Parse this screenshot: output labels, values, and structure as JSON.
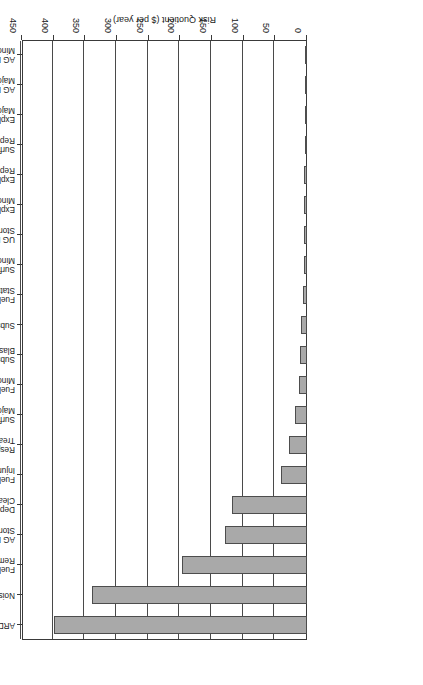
{
  "chart_data": {
    "type": "bar",
    "orientation": "horizontal",
    "title": "",
    "xlabel": "Risk Quotient ($ per year)",
    "ylabel": "",
    "xlim": [
      0,
      450
    ],
    "xticks": [
      0,
      50,
      100,
      150,
      200,
      250,
      300,
      350,
      400,
      450
    ],
    "grid": true,
    "legend": false,
    "rotated_180": true,
    "bar_color": "#a9a9a9",
    "bar_edge_color": "#4d4d4d",
    "categories": [
      "ARD Remediation",
      "Noise Remediation",
      "Fuel Transport Remediation",
      "AG Explosives Storage Repair",
      "Deposited Dust Cleanup",
      "Fuel Transport Major Injury, Death",
      "Respirable Dust Treatment 5 People",
      "Surface Blasting Major Injury, Death",
      "Fuel Transport Minor Injury",
      "Subsurface Blasting Repair",
      "Subsidence Repair",
      "Fuel Transport Statutory Fine",
      "Surface Blasting Minor Injury",
      "UG Explosives Storage Repair",
      "Explosives Transport Minor Injury",
      "Explosives Transport Repair",
      "Surface Blasting Repair",
      "Explosives Transport Major Injury, Death",
      "AG Explosives Storage Major Injury, Death",
      "AG Explosives Storage Minor Injury"
    ],
    "category_lines": [
      [
        "ARD Remediation",
        ""
      ],
      [
        "Noise Remediation",
        ""
      ],
      [
        "Fuel Transport",
        "Remediation"
      ],
      [
        "AG Explosives",
        "Storage Repair"
      ],
      [
        "Deposited Dust",
        "Cleanup"
      ],
      [
        "Fuel Transport Major",
        "Injury, Death"
      ],
      [
        "Respirable Dust",
        "Treatment 5 People"
      ],
      [
        "Surface Blasting",
        "Major Injury, Death"
      ],
      [
        "Fuel Transport",
        "Minor Injury"
      ],
      [
        "Subsurface",
        "Blasting Repair"
      ],
      [
        "Subsidence Repair",
        ""
      ],
      [
        "Fuel Transport",
        "Statutory Fine"
      ],
      [
        "Surface Blasting",
        "Minor Injury"
      ],
      [
        "UG Explosives",
        "Storage Repair"
      ],
      [
        "Explosives Transport",
        "Minor Injury"
      ],
      [
        "Explosives Transport",
        "Repair"
      ],
      [
        "Surface Blasting",
        "Repair"
      ],
      [
        "Explosives Transport",
        "Major Injury, Death"
      ],
      [
        "AG Explosives Storage",
        "Major Injury, Death"
      ],
      [
        "AG Explosives Storage",
        "Minor Injury"
      ]
    ],
    "values": [
      400,
      339,
      198,
      129,
      118,
      41,
      29,
      19,
      13,
      11,
      9,
      6,
      5,
      5,
      4,
      4,
      2,
      2,
      2,
      1
    ]
  }
}
